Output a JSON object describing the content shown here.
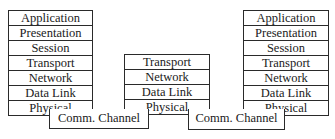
{
  "diagram": {
    "left_stack": {
      "layers": [
        "Application",
        "Presentation",
        "Session",
        "Transport",
        "Network",
        "Data Link",
        "Physical"
      ]
    },
    "middle_stack": {
      "layers": [
        "Transport",
        "Network",
        "Data Link",
        "Physical"
      ]
    },
    "right_stack": {
      "layers": [
        "Application",
        "Presentation",
        "Session",
        "Transport",
        "Network",
        "Data Link",
        "Physical"
      ]
    },
    "channels": [
      {
        "label": "Comm. Channel"
      },
      {
        "label": "Comm. Channel"
      }
    ]
  }
}
